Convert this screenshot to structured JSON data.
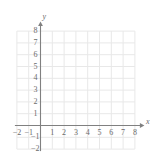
{
  "chart_data": {
    "type": "scatter",
    "title": "",
    "subtitle": "",
    "xlabel": "x",
    "ylabel": "y",
    "xlim": [
      -2,
      8
    ],
    "ylim": [
      -2,
      8
    ],
    "xticks": [
      -2,
      -1,
      1,
      2,
      3,
      4,
      5,
      6,
      7,
      8
    ],
    "yticks": [
      -2,
      -1,
      1,
      2,
      3,
      4,
      5,
      6,
      7,
      8
    ],
    "xtick_labels": [
      "−2",
      "−1",
      "1",
      "2",
      "3",
      "4",
      "5",
      "6",
      "7",
      "8"
    ],
    "ytick_labels": [
      "−2",
      "−1",
      "1",
      "2",
      "3",
      "4",
      "5",
      "6",
      "7",
      "8"
    ],
    "grid": true,
    "grid_step": 1,
    "legend": null,
    "series": [],
    "annotations": [],
    "colors": {
      "background": "#ffffff",
      "grid": "#e8e8e8",
      "axis": "#808080",
      "tick_text": "#6b6b6b"
    }
  },
  "axes": {
    "x_axis_name": "x",
    "y_axis_name": "y"
  }
}
